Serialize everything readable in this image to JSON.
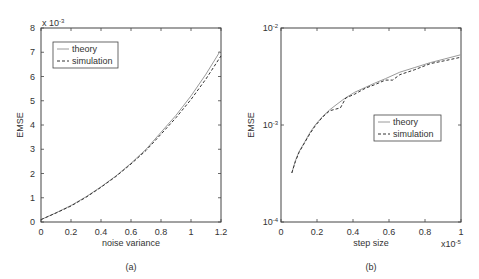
{
  "chart_data": [
    {
      "id": "a",
      "type": "line",
      "caption": "(a)",
      "title": "",
      "xlabel": "noise variance",
      "ylabel": "EMSE",
      "y_multiplier_label": "x 10^-3",
      "xlim": [
        0,
        1.2
      ],
      "ylim": [
        0,
        8
      ],
      "yscale": "linear",
      "xticks": [
        0,
        0.2,
        0.4,
        0.6,
        0.8,
        1,
        1.2
      ],
      "xtick_labels": [
        "0",
        "0.2",
        "0.4",
        "0.6",
        "0.8",
        "1",
        "1.2"
      ],
      "yticks": [
        0,
        1,
        2,
        3,
        4,
        5,
        6,
        7,
        8
      ],
      "ytick_labels": [
        "0",
        "1",
        "2",
        "3",
        "4",
        "5",
        "6",
        "7",
        "8"
      ],
      "grid": false,
      "legend": {
        "position": "upper left",
        "entries": [
          "theory",
          "simulation"
        ]
      },
      "series": [
        {
          "name": "theory",
          "style": "solid",
          "x": [
            0,
            0.1,
            0.2,
            0.3,
            0.4,
            0.5,
            0.6,
            0.7,
            0.8,
            0.9,
            1.0,
            1.1,
            1.2
          ],
          "values": [
            0.1,
            0.38,
            0.68,
            1.04,
            1.45,
            1.9,
            2.42,
            3.0,
            3.7,
            4.4,
            5.2,
            6.1,
            7.1
          ]
        },
        {
          "name": "simulation",
          "style": "dashed",
          "x": [
            0,
            0.1,
            0.2,
            0.3,
            0.4,
            0.5,
            0.6,
            0.7,
            0.8,
            0.9,
            1.0,
            1.1,
            1.2
          ],
          "values": [
            0.1,
            0.37,
            0.66,
            1.02,
            1.43,
            1.88,
            2.39,
            2.95,
            3.62,
            4.3,
            5.05,
            5.9,
            6.85
          ]
        }
      ]
    },
    {
      "id": "b",
      "type": "line",
      "caption": "(b)",
      "title": "",
      "xlabel": "step size",
      "ylabel": "EMSE",
      "x_multiplier_label": "x10^-5",
      "xlim": [
        0,
        1
      ],
      "ylim": [
        0.0001,
        0.01
      ],
      "yscale": "log",
      "xticks": [
        0,
        0.2,
        0.4,
        0.6,
        0.8,
        1
      ],
      "xtick_labels": [
        "0",
        "0.2",
        "0.4",
        "0.6",
        "0.8",
        "1"
      ],
      "yticks": [
        0.0001,
        0.001,
        0.01
      ],
      "ytick_labels": [
        "10^-4",
        "10^-3",
        "10^-2"
      ],
      "grid": false,
      "legend": {
        "position": "center right",
        "entries": [
          "theory",
          "simulation"
        ]
      },
      "series": [
        {
          "name": "theory",
          "style": "solid",
          "x": [
            0.06,
            0.08,
            0.1,
            0.13,
            0.16,
            0.19,
            0.23,
            0.27,
            0.3,
            0.35,
            0.41,
            0.47,
            0.52,
            0.58,
            0.66,
            0.74,
            0.83,
            0.91,
            1.0
          ],
          "values": [
            0.00032,
            0.00043,
            0.00053,
            0.00066,
            0.00083,
            0.001,
            0.00122,
            0.00143,
            0.00158,
            0.00186,
            0.00218,
            0.00245,
            0.0027,
            0.003,
            0.0035,
            0.0039,
            0.0044,
            0.0048,
            0.0053
          ]
        },
        {
          "name": "simulation",
          "style": "dashed",
          "x": [
            0.06,
            0.08,
            0.1,
            0.13,
            0.16,
            0.19,
            0.23,
            0.27,
            0.3,
            0.33,
            0.36,
            0.41,
            0.47,
            0.52,
            0.58,
            0.62,
            0.66,
            0.74,
            0.83,
            0.91,
            1.0
          ],
          "values": [
            0.00032,
            0.00042,
            0.00052,
            0.00065,
            0.00081,
            0.00098,
            0.0012,
            0.0014,
            0.00145,
            0.0015,
            0.0019,
            0.00208,
            0.0024,
            0.0026,
            0.0029,
            0.0029,
            0.0033,
            0.0037,
            0.0043,
            0.0046,
            0.005
          ]
        }
      ]
    }
  ]
}
